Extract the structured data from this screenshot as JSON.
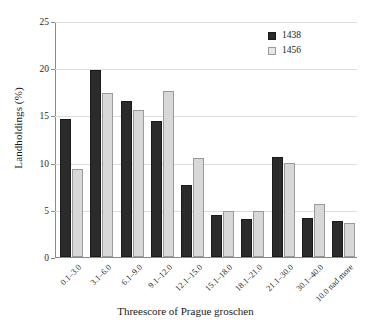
{
  "chart_data": {
    "type": "bar",
    "title": "",
    "xlabel": "Threescore of Prague groschen",
    "ylabel": "Landholdings (%)",
    "categories": [
      "0.1–3.0",
      "3.1–6.0",
      "6.1–9.0",
      "9.1–12.0",
      "12.1–15.0",
      "15.1–18.0",
      "18.1–21.0",
      "21.1–30.0",
      "30.1–40.0",
      "10.0 nad more"
    ],
    "series": [
      {
        "name": "1438",
        "color": "#2b2b2b",
        "values": [
          14.6,
          19.8,
          16.5,
          14.4,
          7.6,
          4.4,
          4.0,
          10.6,
          4.1,
          3.8
        ]
      },
      {
        "name": "1456",
        "color": "#d8d8d8",
        "values": [
          9.3,
          17.4,
          15.6,
          17.6,
          10.5,
          4.9,
          4.9,
          10.0,
          5.6,
          3.6
        ]
      }
    ],
    "ylim": [
      0,
      25
    ],
    "yticks": [
      0,
      5,
      10,
      15,
      20,
      25
    ],
    "ytick_labels": [
      "0",
      "5",
      "10",
      "15",
      "20",
      "25"
    ],
    "grid": "horizontal",
    "legend_position": "top-right"
  },
  "legend": {
    "entries": [
      {
        "label": "1438"
      },
      {
        "label": "1456"
      }
    ]
  },
  "axes": {
    "y_title": "Landholdings (%)",
    "x_title": "Threescore of Prague groschen"
  },
  "caption": {
    "cropped_text": ""
  }
}
